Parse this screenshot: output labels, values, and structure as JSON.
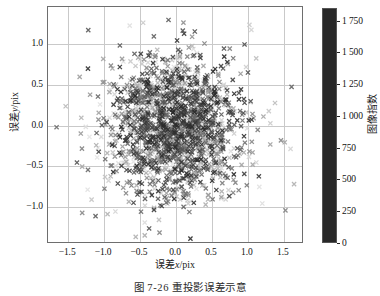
{
  "caption": "图 7-26   重投影误差示意",
  "axes": {
    "xlabel_cn": "误差",
    "xlabel_var": "x",
    "xlabel_unit": "/pix",
    "ylabel_cn": "误差",
    "ylabel_var": "y",
    "ylabel_unit": "/pix",
    "xticks": [
      "-1.5",
      "-1.0",
      "-0.5",
      "0.0",
      "0.5",
      "1.0",
      "1.5"
    ],
    "yticks": [
      "1.0",
      "0.5",
      "0.0",
      "-0.5",
      "-1.0"
    ]
  },
  "colorbar": {
    "label": "图像指数",
    "ticks": [
      "1 750",
      "1 500",
      "1 250",
      "1 000",
      "750",
      "500",
      "250",
      "0"
    ],
    "tick_values": [
      1750,
      1500,
      1250,
      1000,
      750,
      500,
      250,
      0
    ],
    "min": 0,
    "max": 1850,
    "orientation": "vertical",
    "colormap": "gray-cyclic"
  },
  "chart_data": {
    "type": "scatter",
    "title": "",
    "xlabel": "误差x/pix",
    "ylabel": "误差y/pix",
    "xlim": [
      -1.78,
      1.78
    ],
    "ylim": [
      -1.45,
      1.45
    ],
    "xticks": [
      -1.5,
      -1.0,
      -0.5,
      0.0,
      0.5,
      1.0,
      1.5
    ],
    "yticks": [
      -1.0,
      -0.5,
      0.0,
      0.5,
      1.0
    ],
    "grid": true,
    "legend": null,
    "marker": "x",
    "marker_size": 4,
    "n_points": 1850,
    "color_by": "图像指数",
    "color_range": [
      0,
      1850
    ],
    "distribution": {
      "family": "gaussian-2d",
      "mean_x": 0.0,
      "mean_y": 0.0,
      "sigma_x": 0.45,
      "sigma_y": 0.42,
      "correlation": 0.0
    }
  }
}
